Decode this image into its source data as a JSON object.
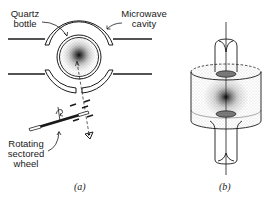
{
  "figure": {
    "panel_a": {
      "caption": "(a)",
      "labels": {
        "quartz_bottle_line1": "Quartz",
        "quartz_bottle_line2": "bottle",
        "microwave_cavity_line1": "Microwave",
        "microwave_cavity_line2": "cavity",
        "rotating_wheel_line1": "Rotating",
        "rotating_wheel_line2": "sectored",
        "rotating_wheel_line3": "wheel"
      }
    },
    "panel_b": {
      "caption": "(b)"
    }
  },
  "colors": {
    "ink": "#1a1a1a",
    "background": "#ffffff"
  }
}
